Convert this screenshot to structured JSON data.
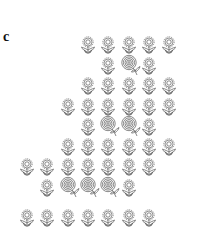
{
  "figure": {
    "panel_label": "c",
    "colors": {
      "stroke": "#555555",
      "background": "#ffffff"
    },
    "column_x": [
      27,
      47,
      68,
      88,
      108,
      129,
      149,
      169
    ],
    "rows": [
      {
        "y": 45,
        "cells": [
          {
            "col": 4,
            "type": "flower"
          },
          {
            "col": 5,
            "type": "flower"
          },
          {
            "col": 6,
            "type": "flower"
          },
          {
            "col": 7,
            "type": "flower"
          },
          {
            "col": 8,
            "type": "flower"
          }
        ]
      },
      {
        "y": 66,
        "cells": [
          {
            "col": 5,
            "type": "flower"
          },
          {
            "col": 6,
            "type": "rose"
          },
          {
            "col": 7,
            "type": "flower"
          }
        ]
      },
      {
        "y": 86,
        "cells": [
          {
            "col": 4,
            "type": "flower"
          },
          {
            "col": 5,
            "type": "flower"
          },
          {
            "col": 6,
            "type": "flower"
          },
          {
            "col": 7,
            "type": "flower"
          },
          {
            "col": 8,
            "type": "flower"
          }
        ]
      },
      {
        "y": 107,
        "cells": [
          {
            "col": 3,
            "type": "flower"
          },
          {
            "col": 4,
            "type": "flower"
          },
          {
            "col": 5,
            "type": "flower"
          },
          {
            "col": 6,
            "type": "flower"
          },
          {
            "col": 7,
            "type": "flower"
          },
          {
            "col": 8,
            "type": "flower"
          }
        ]
      },
      {
        "y": 127,
        "cells": [
          {
            "col": 4,
            "type": "flower"
          },
          {
            "col": 5,
            "type": "rose"
          },
          {
            "col": 6,
            "type": "rose"
          },
          {
            "col": 7,
            "type": "flower"
          }
        ]
      },
      {
        "y": 147,
        "cells": [
          {
            "col": 3,
            "type": "flower"
          },
          {
            "col": 4,
            "type": "flower"
          },
          {
            "col": 5,
            "type": "flower"
          },
          {
            "col": 6,
            "type": "flower"
          },
          {
            "col": 7,
            "type": "flower"
          },
          {
            "col": 8,
            "type": "flower"
          }
        ]
      },
      {
        "y": 167,
        "cells": [
          {
            "col": 1,
            "type": "flower"
          },
          {
            "col": 2,
            "type": "flower"
          },
          {
            "col": 3,
            "type": "flower"
          },
          {
            "col": 4,
            "type": "flower"
          },
          {
            "col": 5,
            "type": "flower"
          },
          {
            "col": 6,
            "type": "flower"
          },
          {
            "col": 7,
            "type": "flower"
          }
        ]
      },
      {
        "y": 188,
        "cells": [
          {
            "col": 2,
            "type": "flower"
          },
          {
            "col": 3,
            "type": "rose"
          },
          {
            "col": 4,
            "type": "rose"
          },
          {
            "col": 5,
            "type": "rose"
          },
          {
            "col": 6,
            "type": "flower"
          }
        ]
      },
      {
        "y": 218,
        "cells": [
          {
            "col": 1,
            "type": "flower"
          },
          {
            "col": 2,
            "type": "flower"
          },
          {
            "col": 3,
            "type": "flower"
          },
          {
            "col": 4,
            "type": "flower"
          },
          {
            "col": 5,
            "type": "flower"
          },
          {
            "col": 6,
            "type": "flower"
          },
          {
            "col": 7,
            "type": "flower"
          }
        ]
      }
    ],
    "glyph_types": {
      "flower": "daisy-flower-icon",
      "rose": "rose-with-stem-icon"
    }
  }
}
